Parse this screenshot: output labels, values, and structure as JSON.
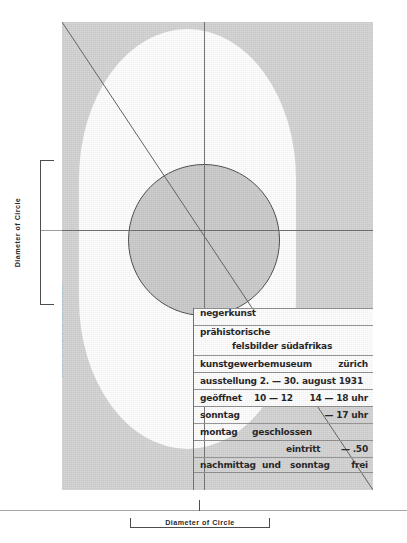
{
  "annotations": {
    "left_label": "Diameter of Circle",
    "bottom_label": "Diameter of Circle"
  },
  "poster": {
    "credit": "entwurf: ktt. ofrabi   druck: buchdruck zürich",
    "background_color": "#d2d2d2",
    "shape_color": "#fdfdfd",
    "circle_color": "#c9c9c9",
    "line_color": "#6d6d6d",
    "text_color": "#1c1c1c",
    "lines": {
      "l1": "negerkunst",
      "l2a": "prähistorische",
      "l2b": "felsbilder  südafrikas",
      "l3a": "kunstgewerbemuseum",
      "l3b": "zürich",
      "l4": "ausstellung 2. — 30. august 1931",
      "l5a": "geöffnet",
      "l5b": "10 — 12",
      "l5c": "14 — 18 uhr",
      "l6a": "sonntag",
      "l6b": "— 17 uhr",
      "l7a": "montag",
      "l7b": "geschlossen",
      "l8a": "eintritt",
      "l8b": "— .50",
      "l9a": "nachmittag",
      "l9b": "und",
      "l9c": "sonntag",
      "l9d": "frei"
    }
  }
}
